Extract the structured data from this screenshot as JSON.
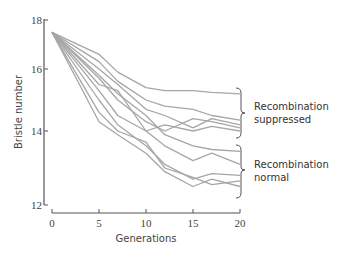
{
  "chart_data": {
    "type": "line",
    "title": "",
    "xlabel": "Generations",
    "ylabel": "Bristle number",
    "xlim": [
      0,
      20
    ],
    "ylim": [
      12,
      18
    ],
    "y_scale_note": "tick spacing is non-uniform (compressed at top)",
    "x_ticks": [
      0,
      5,
      10,
      15,
      20
    ],
    "y_ticks": [
      12,
      14,
      16,
      18
    ],
    "grid": false,
    "line_color": "#a6a6a6",
    "x": [
      0,
      5,
      7,
      10,
      12,
      15,
      17,
      20
    ],
    "series": [
      {
        "name": "suppressed-1",
        "group": "Recombination suppressed",
        "values": [
          17.5,
          16.6,
          15.9,
          15.4,
          15.3,
          15.3,
          15.25,
          15.2
        ]
      },
      {
        "name": "suppressed-2",
        "group": "Recombination suppressed",
        "values": [
          17.5,
          16.3,
          15.6,
          15.0,
          14.8,
          14.7,
          14.5,
          14.35
        ]
      },
      {
        "name": "suppressed-3",
        "group": "Recombination suppressed",
        "values": [
          17.5,
          16.0,
          15.5,
          14.7,
          14.5,
          14.1,
          14.4,
          14.2
        ]
      },
      {
        "name": "suppressed-4",
        "group": "Recombination suppressed",
        "values": [
          17.5,
          15.7,
          15.0,
          14.3,
          14.0,
          14.4,
          14.3,
          14.1
        ]
      },
      {
        "name": "suppressed-5",
        "group": "Recombination suppressed",
        "values": [
          17.5,
          15.5,
          15.3,
          14.0,
          14.2,
          14.0,
          14.15,
          14.0
        ]
      },
      {
        "name": "normal-1",
        "group": "Recombination normal",
        "values": [
          17.5,
          15.8,
          15.2,
          14.5,
          13.9,
          13.6,
          13.5,
          13.45
        ]
      },
      {
        "name": "normal-2",
        "group": "Recombination normal",
        "values": [
          17.5,
          15.3,
          14.5,
          14.0,
          13.6,
          13.2,
          13.4,
          13.1
        ]
      },
      {
        "name": "normal-3",
        "group": "Recombination normal",
        "values": [
          17.5,
          15.0,
          14.2,
          13.6,
          13.1,
          12.7,
          12.85,
          12.8
        ]
      },
      {
        "name": "normal-4",
        "group": "Recombination normal",
        "values": [
          17.5,
          14.6,
          14.0,
          13.7,
          13.0,
          12.75,
          12.55,
          12.65
        ]
      },
      {
        "name": "normal-5",
        "group": "Recombination normal",
        "values": [
          17.5,
          14.3,
          13.9,
          13.4,
          12.9,
          12.5,
          12.7,
          12.5
        ]
      }
    ],
    "annotations": [
      {
        "text": "Recombination suppressed",
        "bracket_range": [
          14.0,
          15.4
        ]
      },
      {
        "text": "Recombination normal",
        "bracket_range": [
          12.4,
          13.6
        ]
      }
    ]
  },
  "labels": {
    "ylabel": "Bristle number",
    "xlabel": "Generations",
    "anno_suppressed_line1": "Recombination",
    "anno_suppressed_line2": "suppressed",
    "anno_normal_line1": "Recombination",
    "anno_normal_line2": "normal"
  }
}
